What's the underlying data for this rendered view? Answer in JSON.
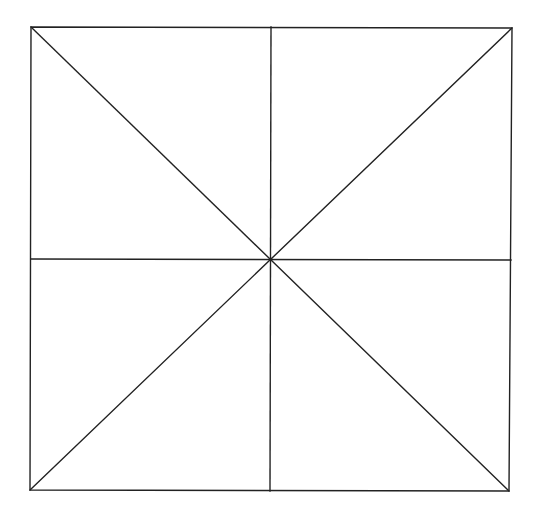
{
  "diagram": {
    "background": "#ffffff",
    "stroke_color": "#222222",
    "stroke_width": 1.4,
    "square": {
      "top_left": [
        31,
        27
      ],
      "top_right": [
        512,
        28
      ],
      "bottom_right": [
        509,
        491
      ],
      "bottom_left": [
        30,
        490
      ]
    },
    "center": [
      271,
      259
    ],
    "lines": [
      {
        "name": "diagonal-tl-br",
        "x1": 31,
        "y1": 27,
        "x2": 509,
        "y2": 491
      },
      {
        "name": "diagonal-tr-bl",
        "x1": 512,
        "y1": 28,
        "x2": 30,
        "y2": 490
      },
      {
        "name": "vertical-midline",
        "x1": 271,
        "y1": 27,
        "x2": 270,
        "y2": 491
      },
      {
        "name": "horizontal-midline",
        "x1": 31,
        "y1": 259,
        "x2": 511,
        "y2": 260
      }
    ]
  }
}
